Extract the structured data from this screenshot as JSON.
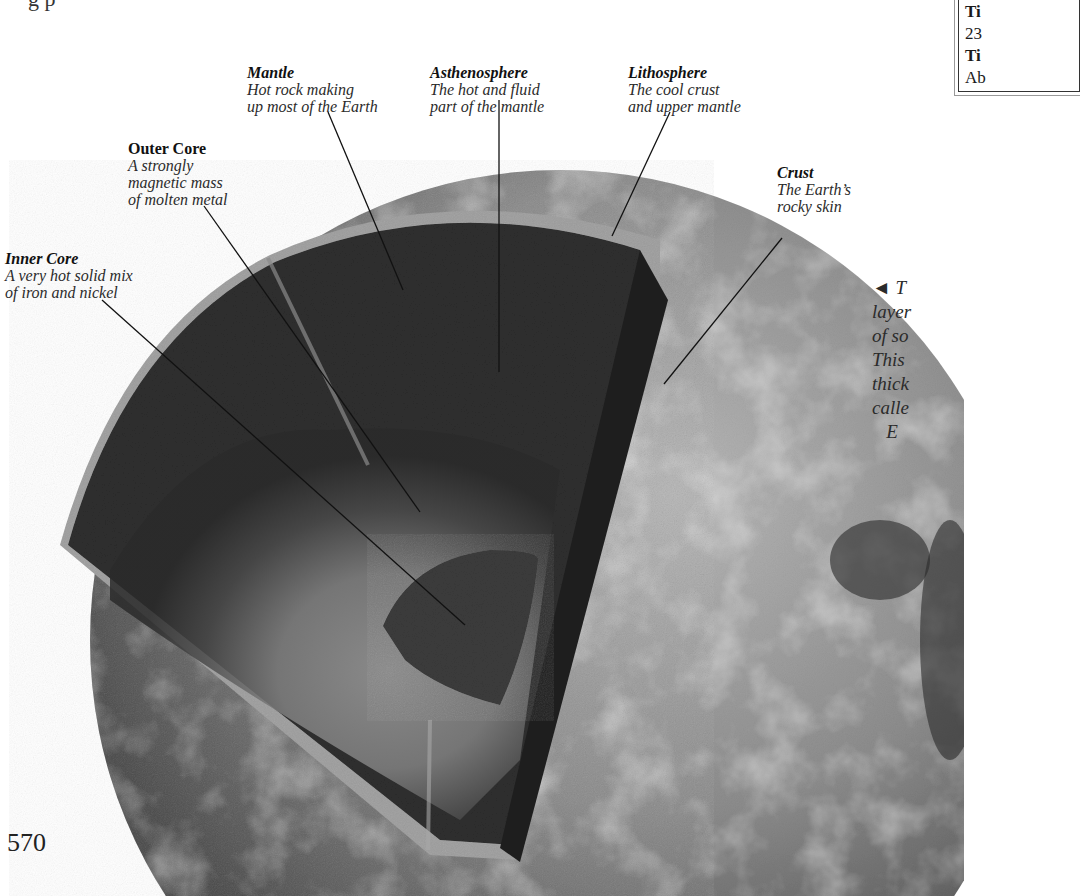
{
  "page": {
    "page_number": "570",
    "top_fragment": "g                                                                  p"
  },
  "diagram": {
    "layers": [
      {
        "name": "Mantle",
        "description": "Hot rock making\nup most of the Earth"
      },
      {
        "name": "Asthenosphere",
        "description": "The hot and fluid\npart of the mantle"
      },
      {
        "name": "Lithosphere",
        "description": "The cool crust\nand upper mantle"
      },
      {
        "name": "Outer Core",
        "description": "A strongly\nmagnetic mass\nof molten metal"
      },
      {
        "name": "Crust",
        "description": "The Earth’s\nrocky skin"
      },
      {
        "name": "Inner Core",
        "description": "A very hot solid mix\nof iron and nickel"
      }
    ]
  },
  "sidebar_box": {
    "lines": [
      "Ti",
      "23",
      "Ti",
      "Ab"
    ]
  },
  "side_caption": {
    "arrow": "◄",
    "text": "◄ T\nlayer\nof so\nThis\nthick\ncalle\n   E"
  },
  "colors": {
    "globe_surface": "#8a8a8a",
    "mantle_dark": "#2f2f2f",
    "outer_core": "#7a7a7a",
    "inner_core": "#3e3e3e",
    "leader_line": "#111111"
  }
}
